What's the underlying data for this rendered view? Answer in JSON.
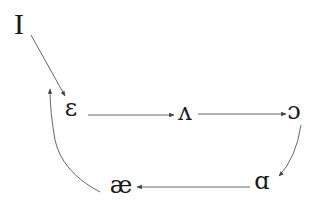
{
  "diagram": {
    "type": "vowel-shift-chain",
    "nodes": [
      {
        "id": "I",
        "label": "I",
        "x": 19,
        "y": 24
      },
      {
        "id": "eh",
        "label": "ɛ",
        "x": 71,
        "y": 109
      },
      {
        "id": "uh",
        "label": "ʌ",
        "x": 185,
        "y": 114
      },
      {
        "id": "oh",
        "label": "ɔ",
        "x": 294,
        "y": 112
      },
      {
        "id": "ah",
        "label": "ɑ",
        "x": 262,
        "y": 182
      },
      {
        "id": "ae",
        "label": "æ",
        "x": 121,
        "y": 186
      }
    ],
    "edges": [
      {
        "from": "I",
        "to": "eh",
        "shape": "straight"
      },
      {
        "from": "eh",
        "to": "uh",
        "shape": "straight"
      },
      {
        "from": "uh",
        "to": "oh",
        "shape": "straight"
      },
      {
        "from": "oh",
        "to": "ah",
        "shape": "curved"
      },
      {
        "from": "ah",
        "to": "ae",
        "shape": "straight"
      },
      {
        "from": "ae",
        "to": "eh",
        "shape": "curved"
      }
    ],
    "colors": {
      "text": "#1a1a1a",
      "arrow": "#555555",
      "background": "#ffffff"
    }
  }
}
